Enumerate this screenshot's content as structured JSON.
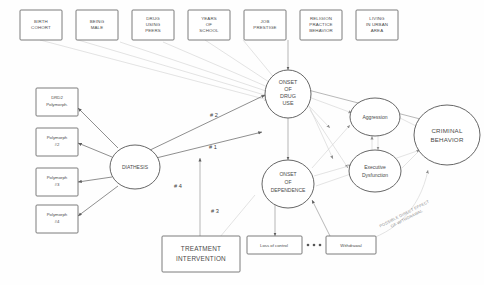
{
  "diagram": {
    "background_color": "#fefefe",
    "line_color": "#6a6a6a",
    "faint_line_color": "#d7d7d7",
    "text_color": "#4a4a4a"
  },
  "top_risk_factors": [
    {
      "id": "birth-cohort",
      "lines": [
        "BIRTH",
        "COHORT"
      ]
    },
    {
      "id": "being-male",
      "lines": [
        "BEING",
        "MALE"
      ]
    },
    {
      "id": "drug-using-peers",
      "lines": [
        "DRUG",
        "USING",
        "PEERS"
      ]
    },
    {
      "id": "years-of-school",
      "lines": [
        "YEARS",
        "OF",
        "SCHOOL"
      ]
    },
    {
      "id": "job-prestige",
      "lines": [
        "JOB",
        "PRESTIGE"
      ]
    },
    {
      "id": "religion-practice",
      "lines": [
        "RELIGION",
        "PRACTICE",
        "BEHAVIOR"
      ]
    },
    {
      "id": "living-urban",
      "lines": [
        "LIVING",
        "IN URBAN",
        "AREA"
      ]
    }
  ],
  "polymorphs": [
    {
      "id": "drd2",
      "lines": [
        "DRD2",
        "Polymorph."
      ]
    },
    {
      "id": "poly2",
      "lines": [
        "Polymorph",
        "#2"
      ]
    },
    {
      "id": "poly3",
      "lines": [
        "Polymorph",
        "#3"
      ]
    },
    {
      "id": "poly4",
      "lines": [
        "Polymorph",
        "#4"
      ]
    }
  ],
  "ellipses": {
    "diathesis": {
      "label": "DIATHESIS"
    },
    "onset_drug_use": {
      "lines": [
        "ONSET",
        "OF",
        "DRUG",
        "USE"
      ]
    },
    "onset_dependence": {
      "lines": [
        "ONSET",
        "OF",
        "DEPENDENCE"
      ]
    },
    "aggression": {
      "label": "Aggression"
    },
    "executive_dysfunction": {
      "lines": [
        "Executive",
        "Dysfunction"
      ]
    },
    "criminal_behavior": {
      "lines": [
        "CRIMINAL",
        "BEHAVIOR"
      ]
    }
  },
  "boxes": {
    "treatment_intervention": {
      "lines": [
        "TREATMENT",
        "INTERVENTION"
      ]
    },
    "loss_of_control": {
      "label": "Loss of control"
    },
    "withdrawal": {
      "label": "Withdrawal"
    },
    "ellipsis": "•••"
  },
  "path_labels": [
    {
      "id": "path-1",
      "text": "# 1"
    },
    {
      "id": "path-2",
      "text": "# 2"
    },
    {
      "id": "path-3",
      "text": "# 3"
    },
    {
      "id": "path-4",
      "text": "# 4"
    }
  ],
  "annotation": {
    "line1": "POSSIBLE DIRECT EFFECT",
    "line2": "OF WITHDRAWAL"
  }
}
